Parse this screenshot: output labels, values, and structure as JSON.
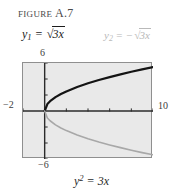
{
  "figure": {
    "label_word": "FIGURE",
    "label_number": "A.7"
  },
  "equations": {
    "y1": {
      "lhs_var": "y",
      "lhs_sub": "1",
      "equals": "=",
      "sign": "",
      "radical_sign": "√",
      "radicand": "3x",
      "color": "#1c1c1c"
    },
    "y2": {
      "lhs_var": "y",
      "lhs_sub": "2",
      "equals": "=",
      "sign": "−",
      "radical_sign": "√",
      "radicand": "3x",
      "color": "#b9b9b9"
    }
  },
  "caption": {
    "var": "y",
    "exponent": "2",
    "equals": "=",
    "rhs": "3x"
  },
  "axis_labels": {
    "top": "6",
    "left": "−2",
    "right": "10",
    "bottom": "−6"
  },
  "chart_data": {
    "type": "line",
    "title": "FIGURE A.7",
    "caption": "y^2 = 3x",
    "xlabel": "",
    "ylabel": "",
    "xlim": [
      -2,
      10
    ],
    "ylim": [
      -6,
      6
    ],
    "grid": false,
    "legend": "inline-labels-above-plot",
    "background": "#e9e9e9",
    "frame_color": "#8f8f8f",
    "axis_color": "#2b2b2b",
    "xticks": [
      -2,
      0,
      2,
      4,
      6,
      8,
      10
    ],
    "yticks": [
      -6,
      -4,
      -2,
      0,
      2,
      4,
      6
    ],
    "series": [
      {
        "name": "y1 = sqrt(3x)",
        "color": "#141414",
        "width": 2.2,
        "x": [
          0,
          0.25,
          0.5,
          1,
          1.5,
          2,
          3,
          4,
          5,
          6,
          7,
          8,
          9,
          10
        ],
        "y": [
          0,
          0.87,
          1.22,
          1.73,
          2.12,
          2.45,
          3.0,
          3.46,
          3.87,
          4.24,
          4.58,
          4.9,
          5.2,
          5.48
        ]
      },
      {
        "name": "y2 = -sqrt(3x)",
        "color": "#a8a8a8",
        "width": 1.6,
        "x": [
          0,
          0.25,
          0.5,
          1,
          1.5,
          2,
          3,
          4,
          5,
          6,
          7,
          8,
          9,
          10
        ],
        "y": [
          0,
          -0.87,
          -1.22,
          -1.73,
          -2.12,
          -2.45,
          -3.0,
          -3.46,
          -3.87,
          -4.24,
          -4.58,
          -4.9,
          -5.2,
          -5.48
        ]
      }
    ]
  }
}
